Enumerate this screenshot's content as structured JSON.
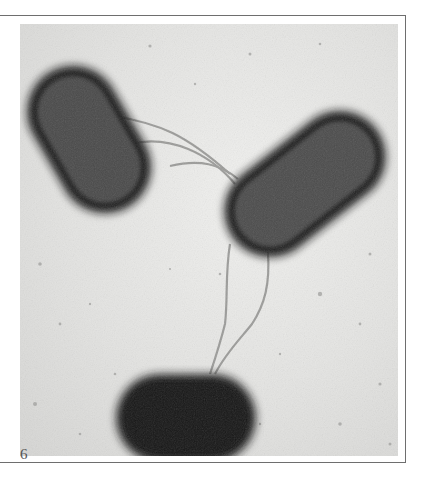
{
  "figure": {
    "panel_number": "6",
    "image_description": "Electron micrograph of three rod-shaped bacteria connected by thin filaments",
    "colors": {
      "background": "#e8e8e6",
      "cell_interior": "#4a4a4a",
      "cell_border": "#141414",
      "frame_line": "#6e6e6e"
    }
  }
}
